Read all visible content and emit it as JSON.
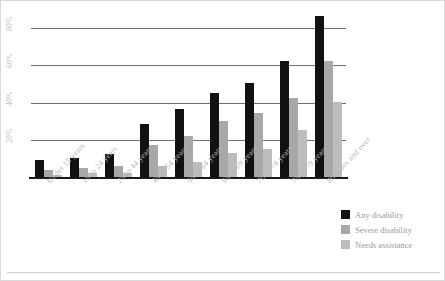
{
  "chart_data": {
    "type": "bar",
    "title": "",
    "subtitle": "",
    "xlabel": "",
    "ylabel": "",
    "ylim": [
      0,
      90
    ],
    "grid": true,
    "grid_orientation": "horizontal",
    "legend_position": "bottom-right",
    "y_ticks": [
      "20%",
      "40%",
      "60%",
      "80%"
    ],
    "y_tick_values": [
      20,
      40,
      60,
      80
    ],
    "categories": [
      "Under 15 years",
      "15 to 24 years",
      "25 to 44 years",
      "45 to 54 years",
      "55 to 64 years",
      "65 to 69 years",
      "70 to 74 years",
      "75 to 79 years",
      "80 years and over"
    ],
    "series": [
      {
        "name": "Any disability",
        "color": "#111111",
        "values": [
          9,
          10,
          12,
          28,
          36,
          45,
          50,
          62,
          86
        ]
      },
      {
        "name": "Severe disability",
        "color": "#a8a8a8",
        "values": [
          4,
          5,
          6,
          17,
          22,
          30,
          34,
          42,
          62
        ]
      },
      {
        "name": "Needs assistance",
        "color": "#bdbdbd",
        "values": [
          1,
          2,
          2,
          6,
          8,
          13,
          15,
          25,
          40
        ]
      }
    ]
  },
  "colors": {
    "any_disability": "#111111",
    "severe_disability": "#a8a8a8",
    "needs_assistance": "#bdbdbd",
    "gridline": "#6f6f6f",
    "axis": "#1a1a1a",
    "tick_text": "#b5b5b5",
    "legend_text": "#9a9a9a",
    "background": "#ffffff"
  }
}
